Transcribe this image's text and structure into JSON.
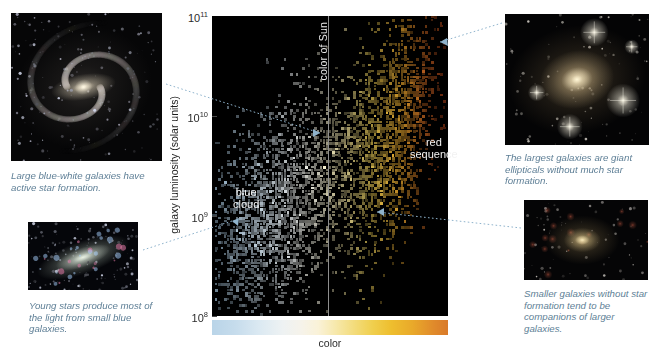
{
  "figure": {
    "xlabel": "color",
    "ylabel": "galaxy luminosity (solar units)",
    "sun_line_label": "color of Sun"
  },
  "axis": {
    "yticks": [
      "10¹¹",
      "10¹⁰",
      "10⁹",
      "10⁸"
    ],
    "ytick_values": [
      100000000000.0,
      10000000000.0,
      1000000000.0,
      100000000.0
    ]
  },
  "plot_labels": {
    "blue_cloud": "blue\ncloud",
    "blue_cloud_line1": "blue",
    "blue_cloud_line2": "cloud",
    "red_sequence_line1": "red",
    "red_sequence_line2": "sequence"
  },
  "captions": {
    "spiral": "Large blue-white galaxies have active star formation.",
    "irregular": "Young stars produce most of the light from small blue galaxies.",
    "elliptical": "The largest galaxies are giant ellipticals without much star formation.",
    "dwarf": "Smaller galaxies without star formation tend to be companions of larger galaxies."
  },
  "images": {
    "spiral": "barred-spiral-galaxy-photo",
    "irregular": "irregular-blue-galaxy-photo",
    "elliptical": "giant-elliptical-galaxy-photo",
    "dwarf": "dwarf-elliptical-galaxy-photo"
  },
  "colors": {
    "caption_text": "#5e7f96",
    "plot_background": "#000000",
    "sun_line": "#8e8e8e",
    "colorbar_blue_end": "#b9d4e8",
    "colorbar_mid": "#f6f3ea",
    "colorbar_red_end": "#d97a2a",
    "leader_line": "#8fb3cc"
  },
  "chart_data": {
    "type": "scatter",
    "xlabel": "color",
    "ylabel": "galaxy luminosity (solar units)",
    "xlim": [
      0,
      1
    ],
    "ylim": [
      100000000.0,
      100000000000.0
    ],
    "yscale": "log",
    "ytick_labels": [
      "10⁸",
      "10⁹",
      "10¹⁰",
      "10¹¹"
    ],
    "ytick_values": [
      100000000.0,
      1000000000.0,
      10000000000.0,
      100000000000.0
    ],
    "grid": false,
    "legend": "none",
    "annotations": [
      {
        "text": "color of Sun",
        "type": "vertical-line",
        "x": 0.49
      },
      {
        "text": "blue cloud",
        "x": 0.13,
        "y": 1100000000.0
      },
      {
        "text": "red sequence",
        "x": 0.84,
        "y": 3000000000.0
      }
    ],
    "point_color_encoding": "point color reflects galaxy color: blue-white at left, yellow-white at center, orange-red at right",
    "populations": [
      {
        "name": "blue cloud",
        "n_points": 2100,
        "color_center": 0.27,
        "color_spread": 0.13,
        "log_lum_center": 9.05,
        "log_lum_spread": 0.52,
        "slope_color_vs_logL": 0.115,
        "description": "star-forming blue and blue-white galaxies, spanning low to intermediate luminosity"
      },
      {
        "name": "red sequence",
        "n_points": 1500,
        "color_center": 0.77,
        "color_spread": 0.085,
        "log_lum_center": 9.85,
        "log_lum_spread": 0.58,
        "slope_color_vs_logL": 0.075,
        "description": "passively evolving red galaxies, dominated by giant ellipticals at the bright end"
      },
      {
        "name": "green valley",
        "n_points": 420,
        "color_center": 0.55,
        "color_spread": 0.09,
        "log_lum_center": 9.5,
        "log_lum_spread": 0.45,
        "slope_color_vs_logL": 0.06,
        "description": "sparse transition region between the blue cloud and the red sequence"
      }
    ]
  }
}
